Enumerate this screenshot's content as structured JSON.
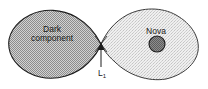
{
  "figure": {
    "name": "roche-lobe-binary-star-diagram",
    "background_color": "#ffffff",
    "width": 208,
    "height": 89
  },
  "labels": {
    "dark_component_line1": "Dark",
    "dark_component_line2": "component",
    "nova": "Nova",
    "lagrange_point": "L",
    "lagrange_point_subscript": "1"
  },
  "colors": {
    "dark_lobe_fill": "#c9c9c9",
    "dark_lobe_stipple": "#8f8f8f",
    "dark_lobe_outline": "#1c1c1c",
    "bright_lobe_fill": "#ececec",
    "bright_lobe_stipple": "#bfbfbf",
    "bright_lobe_outline": "#3a3a3a",
    "nova_core_fill": "#8a8a8a",
    "nova_core_outline": "#1c1c1c",
    "arrow_color": "#1c1c1c",
    "text_color": "#1a1a1a"
  },
  "shapes": {
    "dark_component_lobe": {
      "type": "teardrop",
      "side": "left",
      "apex_x": 101,
      "center_x": 50,
      "center_y": 42
    },
    "bright_nova_lobe": {
      "type": "teardrop",
      "side": "right",
      "apex_x": 101,
      "center_x": 150,
      "center_y": 42
    },
    "nova_core": {
      "type": "circle",
      "cx": 157,
      "cy": 44,
      "r": 8
    },
    "l1_arrow": {
      "type": "arrow",
      "from_x": 101,
      "from_y": 67,
      "to_x": 101,
      "to_y": 44
    }
  }
}
